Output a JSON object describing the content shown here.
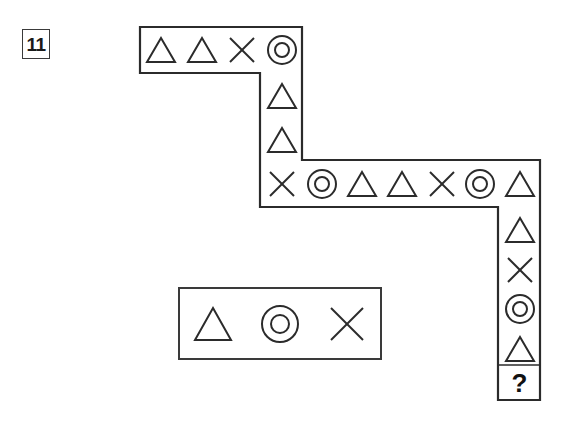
{
  "puzzle": {
    "number": "11",
    "question_mark": "?"
  },
  "sequence": {
    "description": "L-shaped path of symbol cells read left-to-right then down",
    "top_row": [
      {
        "symbol": "triangle",
        "label": "triangle-icon"
      },
      {
        "symbol": "triangle",
        "label": "triangle-icon"
      },
      {
        "symbol": "cross",
        "label": "cross-icon"
      },
      {
        "symbol": "circle",
        "label": "concentric-circle-icon"
      }
    ],
    "upper_column": [
      {
        "symbol": "triangle",
        "label": "triangle-icon"
      },
      {
        "symbol": "triangle",
        "label": "triangle-icon"
      }
    ],
    "middle_row": [
      {
        "symbol": "cross",
        "label": "cross-icon"
      },
      {
        "symbol": "circle",
        "label": "concentric-circle-icon"
      },
      {
        "symbol": "triangle",
        "label": "triangle-icon"
      },
      {
        "symbol": "triangle",
        "label": "triangle-icon"
      },
      {
        "symbol": "cross",
        "label": "cross-icon"
      },
      {
        "symbol": "circle",
        "label": "concentric-circle-icon"
      },
      {
        "symbol": "triangle",
        "label": "triangle-icon"
      }
    ],
    "lower_column": [
      {
        "symbol": "triangle",
        "label": "triangle-icon"
      },
      {
        "symbol": "cross",
        "label": "cross-icon"
      },
      {
        "symbol": "circle",
        "label": "concentric-circle-icon"
      },
      {
        "symbol": "triangle",
        "label": "triangle-icon"
      },
      {
        "symbol": "question",
        "label": "question-mark-cell"
      }
    ]
  },
  "options": [
    {
      "symbol": "triangle",
      "label": "triangle-icon"
    },
    {
      "symbol": "circle",
      "label": "concentric-circle-icon"
    },
    {
      "symbol": "cross",
      "label": "cross-icon"
    }
  ],
  "colors": {
    "stroke": "#2b2b2b",
    "background": "#ffffff",
    "text": "#1a1a1a"
  }
}
